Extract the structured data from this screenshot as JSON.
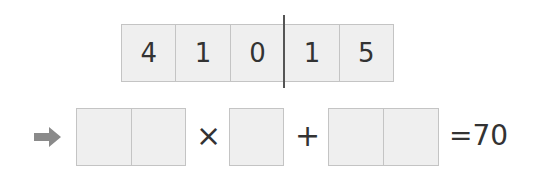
{
  "digit_cards": [
    "4",
    "1",
    "0",
    "1",
    "5"
  ],
  "expression": {
    "arrow_icon": "right-arrow",
    "operator_multiply": "×",
    "operator_plus": "+",
    "result": "=70"
  },
  "colors": {
    "cell_fill": "#efefef",
    "cell_border": "#c4c4c4",
    "arrow": "#8a8a8a",
    "divider": "#555555"
  }
}
